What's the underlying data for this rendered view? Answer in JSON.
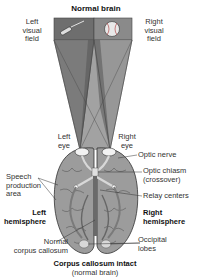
{
  "title": "Normal brain",
  "labels": {
    "left_visual_field": "Left\nvisual\nfield",
    "right_visual_field": "Right\nvisual\nfield",
    "left_eye": "Left\neye",
    "right_eye": "Right\neye",
    "optic_nerve": "Optic nerve",
    "optic_chiasm": "Optic chiasm",
    "crossover": "(crossover)",
    "speech_area": "Speech\nproduction\narea",
    "relay_centers": "Relay centers",
    "left_hemisphere": "Left\nhemisphere",
    "right_hemisphere": "Right\nhemisphere",
    "normal_corpus_callosum": "Normal\ncorpus callosum",
    "occipital_lobes": "Occipital\nlobes"
  },
  "caption": {
    "main": "Corpus callosum intact",
    "sub": "(normal brain)"
  },
  "visual_field": {
    "left_object": "screwdriver",
    "right_object": "baseball"
  },
  "colors": {
    "left_field": "#6e6e6e",
    "right_field": "#8a8a8a",
    "light_cone": "#b8b8b8",
    "brain": "#9a9a9a",
    "brain_outline": "#333333"
  }
}
